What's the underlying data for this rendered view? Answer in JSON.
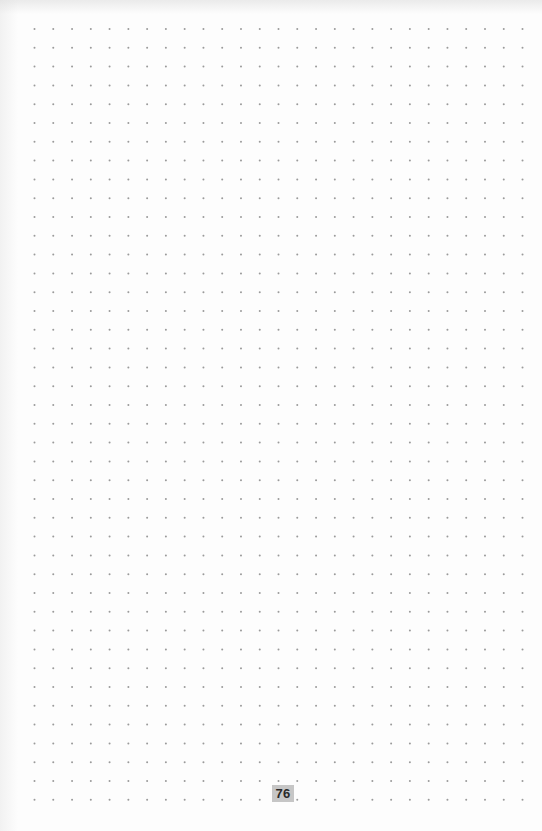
{
  "page": {
    "type": "dot-grid-notebook-page",
    "background_color": "#fdfdfd",
    "page_number": "76",
    "page_number_bg": "#c6c6c6",
    "page_number_color": "#2a2a2a"
  },
  "grid": {
    "dot_color": "#9a9a9a",
    "dot_radius": 1,
    "columns": 27,
    "rows": 42,
    "origin_x": 34.5,
    "origin_y": 29,
    "spacing_x": 18.77,
    "spacing_y": 18.8
  }
}
